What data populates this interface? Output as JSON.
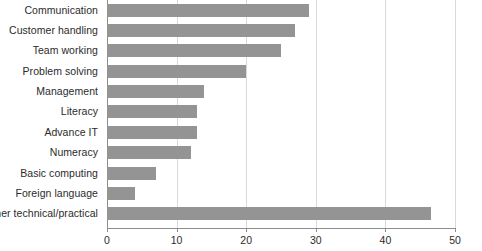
{
  "chart_data": {
    "type": "bar",
    "orientation": "horizontal",
    "title": "",
    "subtitle": "",
    "xlabel": "",
    "ylabel": "",
    "categories": [
      "Communication",
      "Customer handling",
      "Team working",
      "Problem solving",
      "Management",
      "Literacy",
      "Advance IT",
      "Numeracy",
      "Basic computing",
      "Foreign language",
      "Other technical/practical"
    ],
    "values": [
      29,
      27,
      25,
      20,
      14,
      13,
      13,
      12,
      7,
      4,
      46.5
    ],
    "series": [
      {
        "name": "",
        "values": [
          29,
          27,
          25,
          20,
          14,
          13,
          13,
          12,
          7,
          4,
          46.5
        ]
      }
    ],
    "xlim": [
      0,
      50
    ],
    "xticks": [
      0,
      10,
      20,
      30,
      40,
      50
    ],
    "xtick_labels": [
      "0",
      "10",
      "20",
      "30",
      "40",
      "50"
    ],
    "grid": "vertical",
    "legend": false,
    "legend_position": "none",
    "bar_color": "#949494",
    "gridline_color": "#d9d9d9",
    "axis_color": "#8d8d8d",
    "text_color": "#2b2b2b",
    "background_color": "#ffffff",
    "annotations": []
  }
}
